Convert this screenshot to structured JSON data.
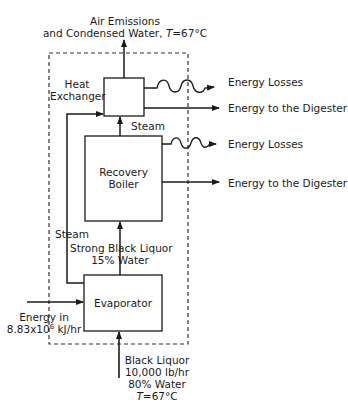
{
  "diagram": {
    "boundary": "dashed system boundary",
    "nodes": {
      "heat_exchanger": {
        "label_line1": "Heat",
        "label_line2": "Exchanger"
      },
      "recovery_boiler": {
        "label_line1": "Recovery",
        "label_line2": "Boiler"
      },
      "evaporator": {
        "label": "Evaporator"
      }
    },
    "outputs": {
      "air_emissions_line1": "Air Emissions",
      "air_emissions_line2_prefix": "and Condensed Water, ",
      "air_emissions_T": "T",
      "air_emissions_value": "=67°C",
      "hx_energy_losses": "Energy Losses",
      "hx_energy_digester": "Energy to the Digester",
      "rb_energy_losses": "Energy Losses",
      "rb_energy_digester": "Energy to the Digester"
    },
    "internal_flows": {
      "steam_rb_to_hx": "Steam",
      "steam_evap_to_hx": "Steam",
      "strong_liquor_line1": "Strong Black Liquor",
      "strong_liquor_line2": "15% Water"
    },
    "inputs": {
      "energy_in_line1": "Energy in",
      "energy_in_value": "8.83x10",
      "energy_in_exp": "6",
      "energy_in_unit": " kJ/hr",
      "black_liquor_line1": "Black Liquor",
      "black_liquor_line2": "10,000 lb/hr",
      "black_liquor_line3": "80% Water",
      "black_liquor_T": "T",
      "black_liquor_Tvalue": "=67°C"
    }
  }
}
